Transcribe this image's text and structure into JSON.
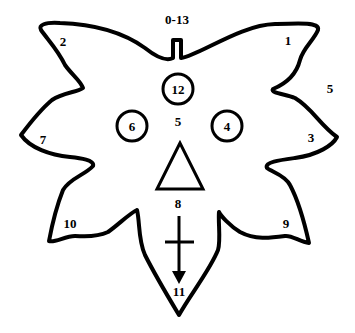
{
  "diagram": {
    "type": "leaf-shaped outline with numbered points",
    "colors": {
      "stroke": "#000000",
      "background": "#ffffff"
    },
    "labels": {
      "top": "0-13",
      "top_right_tip": "1",
      "top_left_tip": "2",
      "right_tip": "3",
      "right_eye": "4",
      "right_outer": "5",
      "center": "5",
      "left_eye": "6",
      "left_tip": "7",
      "below_triangle": "8",
      "bottom_right_tip": "9",
      "bottom_left_tip": "10",
      "bottom": "11",
      "top_circle": "12"
    },
    "shapes": {
      "circles": [
        "12",
        "6",
        "4"
      ],
      "triangle": "triangle-icon",
      "cross_arrow": "cross-arrow-icon"
    }
  }
}
